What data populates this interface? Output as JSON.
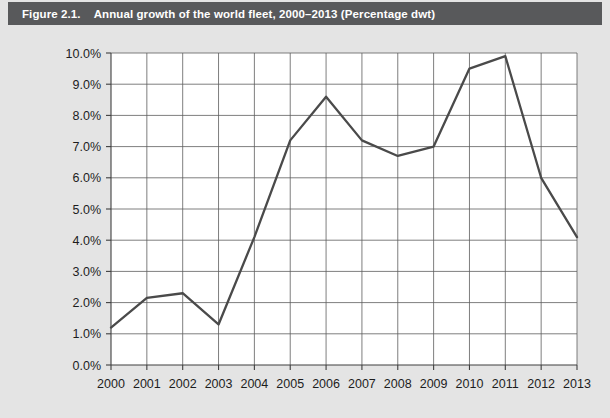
{
  "figure": {
    "number": "Figure 2.1.",
    "title": "Annual growth of the world fleet, 2000–2013 (Percentage dwt)",
    "banner_color": "#58595b",
    "card_color": "#e4e4e4"
  },
  "chart_data": {
    "type": "line",
    "title": "Annual growth of the world fleet, 2000–2013 (Percentage dwt)",
    "xlabel": "",
    "ylabel": "",
    "categories": [
      "2000",
      "2001",
      "2002",
      "2003",
      "2004",
      "2005",
      "2006",
      "2007",
      "2008",
      "2009",
      "2010",
      "2011",
      "2012",
      "2013"
    ],
    "values": [
      1.2,
      2.15,
      2.3,
      1.3,
      4.1,
      7.2,
      8.6,
      7.2,
      6.7,
      7.0,
      9.5,
      9.9,
      6.0,
      4.1
    ],
    "series": [
      {
        "name": "Annual growth of the world fleet",
        "color": "#4a4a4a",
        "values": [
          1.2,
          2.15,
          2.3,
          1.3,
          4.1,
          7.2,
          8.6,
          7.2,
          6.7,
          7.0,
          9.5,
          9.9,
          6.0,
          4.1
        ]
      }
    ],
    "ylim": [
      0,
      10
    ],
    "ytick_values": [
      0,
      1,
      2,
      3,
      4,
      5,
      6,
      7,
      8,
      9,
      10
    ],
    "ytick_labels": [
      "0.0%",
      "1.0%",
      "2.0%",
      "3.0%",
      "4.0%",
      "5.0%",
      "6.0%",
      "7.0%",
      "8.0%",
      "9.0%",
      "10.0%"
    ],
    "xtick_labels": [
      "2000",
      "2001",
      "2002",
      "2003",
      "2004",
      "2005",
      "2006",
      "2007",
      "2008",
      "2009",
      "2010",
      "2011",
      "2012",
      "2013"
    ],
    "grid": true,
    "grid_axis": "both",
    "legend": false,
    "legend_position": "none",
    "unit": "percent"
  }
}
